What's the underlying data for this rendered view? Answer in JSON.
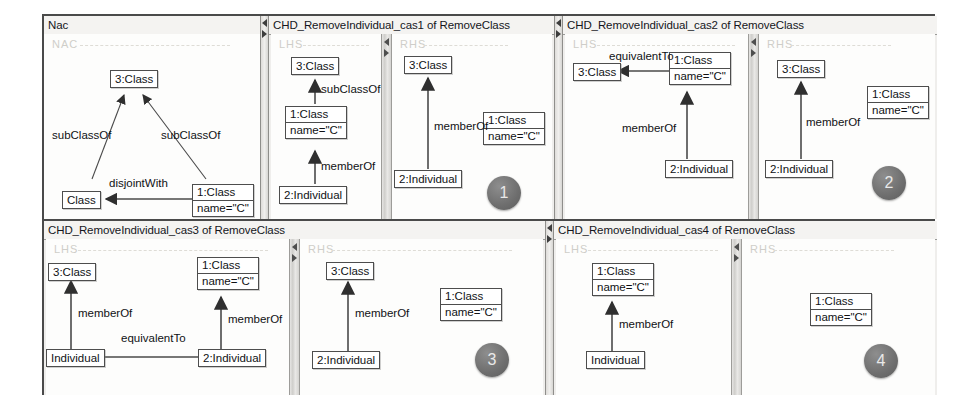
{
  "app": {
    "kind": "graph-transformation-rule-editor",
    "badge_color": "#6e6e6e"
  },
  "panels": [
    {
      "id": "nac",
      "title": "Nac",
      "badge": null,
      "canvases": [
        {
          "id": "nac-canvas",
          "group_label": "NAC",
          "nodes": [
            {
              "id": "n3class",
              "lines": [
                "3:Class"
              ]
            },
            {
              "id": "nclass",
              "lines": [
                "Class"
              ]
            },
            {
              "id": "n1class",
              "lines": [
                "1:Class",
                "name=\"C\""
              ]
            }
          ],
          "edges": [
            {
              "label": "subClassOf",
              "from": "nclass",
              "to": "n3class"
            },
            {
              "label": "subClassOf",
              "from": "n1class",
              "to": "n3class"
            },
            {
              "label": "disjointWith",
              "from": "n1class",
              "to": "nclass"
            }
          ]
        }
      ]
    },
    {
      "id": "cas1",
      "title": "CHD_RemoveIndividual_cas1 of RemoveClass",
      "badge": "1",
      "canvases": [
        {
          "id": "cas1-lhs",
          "group_label": "LHS",
          "nodes": [
            {
              "id": "l3class",
              "lines": [
                "3:Class"
              ]
            },
            {
              "id": "l1class",
              "lines": [
                "1:Class",
                "name=\"C\""
              ]
            },
            {
              "id": "l2ind",
              "lines": [
                "2:Individual"
              ]
            }
          ],
          "edges": [
            {
              "label": "subClassOf",
              "from": "l1class",
              "to": "l3class"
            },
            {
              "label": "memberOf",
              "from": "l2ind",
              "to": "l1class"
            }
          ]
        },
        {
          "id": "cas1-rhs",
          "group_label": "RHS",
          "nodes": [
            {
              "id": "r3class",
              "lines": [
                "3:Class"
              ]
            },
            {
              "id": "r2ind",
              "lines": [
                "2:Individual"
              ]
            },
            {
              "id": "r1class",
              "lines": [
                "1:Class",
                "name=\"C\""
              ]
            }
          ],
          "edges": [
            {
              "label": "memberOf",
              "from": "r2ind",
              "to": "r3class"
            }
          ]
        }
      ]
    },
    {
      "id": "cas2",
      "title": "CHD_RemoveIndividual_cas2 of RemoveClass",
      "badge": "2",
      "canvases": [
        {
          "id": "cas2-lhs",
          "group_label": "LHS",
          "nodes": [
            {
              "id": "l3class",
              "lines": [
                "3:Class"
              ]
            },
            {
              "id": "l1class",
              "lines": [
                "1:Class",
                "name=\"C\""
              ]
            },
            {
              "id": "l2ind",
              "lines": [
                "2:Individual"
              ]
            }
          ],
          "edges": [
            {
              "label": "equivalentTo",
              "from": "l1class",
              "to": "l3class"
            },
            {
              "label": "memberOf",
              "from": "l2ind",
              "to": "l1class"
            }
          ]
        },
        {
          "id": "cas2-rhs",
          "group_label": "RHS",
          "nodes": [
            {
              "id": "r3class",
              "lines": [
                "3:Class"
              ]
            },
            {
              "id": "r2ind",
              "lines": [
                "2:Individual"
              ]
            },
            {
              "id": "r1class",
              "lines": [
                "1:Class",
                "name=\"C\""
              ]
            }
          ],
          "edges": [
            {
              "label": "memberOf",
              "from": "r2ind",
              "to": "r3class"
            }
          ]
        }
      ]
    },
    {
      "id": "cas3",
      "title": "CHD_RemoveIndividual_cas3 of RemoveClass",
      "badge": "3",
      "canvases": [
        {
          "id": "cas3-lhs",
          "group_label": "LHS",
          "nodes": [
            {
              "id": "l3class",
              "lines": [
                "3:Class"
              ]
            },
            {
              "id": "l1class",
              "lines": [
                "1:Class",
                "name=\"C\""
              ]
            },
            {
              "id": "lind",
              "lines": [
                "Individual"
              ]
            },
            {
              "id": "l2ind",
              "lines": [
                "2:Individual"
              ]
            }
          ],
          "edges": [
            {
              "label": "memberOf",
              "from": "lind",
              "to": "l3class"
            },
            {
              "label": "memberOf",
              "from": "l2ind",
              "to": "l1class"
            },
            {
              "label": "equivalentTo",
              "from": "l2ind",
              "to": "lind"
            }
          ]
        },
        {
          "id": "cas3-rhs",
          "group_label": "RHS",
          "nodes": [
            {
              "id": "r3class",
              "lines": [
                "3:Class"
              ]
            },
            {
              "id": "r2ind",
              "lines": [
                "2:Individual"
              ]
            },
            {
              "id": "r1class",
              "lines": [
                "1:Class",
                "name=\"C\""
              ]
            }
          ],
          "edges": [
            {
              "label": "memberOf",
              "from": "r2ind",
              "to": "r3class"
            }
          ]
        }
      ]
    },
    {
      "id": "cas4",
      "title": "CHD_RemoveIndividual_cas4 of RemoveClass",
      "badge": "4",
      "canvases": [
        {
          "id": "cas4-lhs",
          "group_label": "LHS",
          "nodes": [
            {
              "id": "l1class",
              "lines": [
                "1:Class",
                "name=\"C\""
              ]
            },
            {
              "id": "lind",
              "lines": [
                "Individual"
              ]
            }
          ],
          "edges": [
            {
              "label": "memberOf",
              "from": "lind",
              "to": "l1class"
            }
          ]
        },
        {
          "id": "cas4-rhs",
          "group_label": "RHS",
          "nodes": [
            {
              "id": "r1class",
              "lines": [
                "1:Class",
                "name=\"C\""
              ]
            }
          ],
          "edges": []
        }
      ]
    }
  ],
  "labels": {
    "nac_group": "NAC",
    "lhs_group": "LHS",
    "rhs_group": "RHS",
    "nac_3class": "3:Class",
    "nac_class": "Class",
    "class1_l1": "1:Class",
    "class1_l2": "name=\"C\"",
    "class3": "3:Class",
    "ind2": "2:Individual",
    "ind": "Individual",
    "e_subclassof": "subClassOf",
    "e_memberof": "memberOf",
    "e_equivalentto": "equivalentTo",
    "e_disjointwith": "disjointWith"
  },
  "titles": {
    "nac": "Nac",
    "cas1": "CHD_RemoveIndividual_cas1 of RemoveClass",
    "cas2": "CHD_RemoveIndividual_cas2 of RemoveClass",
    "cas3": "CHD_RemoveIndividual_cas3 of RemoveClass",
    "cas4": "CHD_RemoveIndividual_cas4 of RemoveClass"
  },
  "badges": {
    "one": "1",
    "two": "2",
    "three": "3",
    "four": "4"
  }
}
